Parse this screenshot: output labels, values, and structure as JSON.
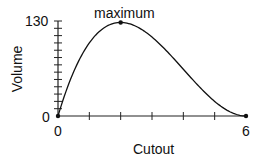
{
  "chart_data": {
    "type": "line",
    "title": "",
    "xlabel": "Cutout",
    "ylabel": "Volume",
    "xlim": [
      0,
      6
    ],
    "ylim": [
      0,
      130
    ],
    "x_tick_labels": [
      "0",
      "6"
    ],
    "x_ticks": [
      0,
      1,
      2,
      3,
      4,
      5,
      6
    ],
    "y_tick_labels": [
      "0",
      "130"
    ],
    "y_minor_tick_step": 10,
    "grid": false,
    "legend": null,
    "function": "V = x(12 - 2x)^2",
    "series": [
      {
        "name": "Volume",
        "x": [
          0,
          0.5,
          1,
          1.5,
          2,
          2.5,
          3,
          3.5,
          4,
          4.5,
          5,
          5.5,
          6
        ],
        "values": [
          0,
          60.5,
          100,
          121.5,
          128,
          122.5,
          108,
          87.5,
          64,
          40.5,
          20,
          5.5,
          0
        ]
      }
    ],
    "points": [
      {
        "x": 0,
        "y": 0
      },
      {
        "x": 2,
        "y": 128,
        "label": "maximum"
      },
      {
        "x": 6,
        "y": 0
      }
    ],
    "annotations": [
      {
        "text": "maximum",
        "x": 2,
        "y": 128
      }
    ]
  },
  "labels": {
    "x_axis": "Cutout",
    "y_axis": "Volume",
    "x_min": "0",
    "x_max": "6",
    "y_min": "0",
    "y_max": "130",
    "annotation": "maximum"
  },
  "colors": {
    "line": "#111111",
    "axis": "#222222",
    "background": "#ffffff"
  }
}
